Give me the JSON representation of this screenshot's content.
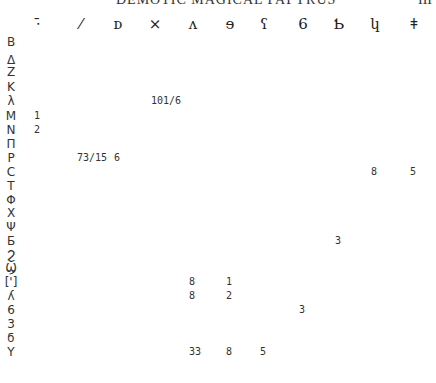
{
  "header": {
    "title": "DEMOTIC MAGICAL PAPYRUS",
    "page_number": "III"
  },
  "table": {
    "columns": [
      {
        "glyph": "⋅̄",
        "name": "demotic-sign-1",
        "x": 38
      },
      {
        "glyph": "⁄",
        "name": "demotic-sign-2",
        "x": 81
      },
      {
        "glyph": "ᴅ",
        "name": "demotic-sign-3",
        "x": 118
      },
      {
        "glyph": "×",
        "name": "demotic-sign-4",
        "x": 155
      },
      {
        "glyph": "ʌ",
        "name": "demotic-sign-5",
        "x": 193
      },
      {
        "glyph": "ɘ",
        "name": "demotic-sign-6",
        "x": 230
      },
      {
        "glyph": "ʕ",
        "name": "demotic-sign-7",
        "x": 264
      },
      {
        "glyph": "6",
        "name": "demotic-sign-8",
        "x": 303
      },
      {
        "glyph": "Ƅ",
        "name": "demotic-sign-9",
        "x": 339
      },
      {
        "glyph": "կ",
        "name": "demotic-sign-10",
        "x": 375
      },
      {
        "glyph": "ǂ",
        "name": "demotic-sign-11",
        "x": 414
      }
    ],
    "rows": [
      {
        "label": "B",
        "y": 42,
        "cells": []
      },
      {
        "label": "Δ",
        "y": 60,
        "cells": []
      },
      {
        "label": "Z",
        "y": 72,
        "cells": []
      },
      {
        "label": "K",
        "y": 87,
        "cells": []
      },
      {
        "label": "λ",
        "y": 101,
        "cells": [
          {
            "col": 3,
            "value": "101/6"
          }
        ]
      },
      {
        "label": "M",
        "y": 116,
        "cells": [
          {
            "col": 0,
            "value": "1"
          }
        ]
      },
      {
        "label": "N",
        "y": 130,
        "cells": [
          {
            "col": 0,
            "value": "2"
          }
        ]
      },
      {
        "label": "Π",
        "y": 144,
        "cells": []
      },
      {
        "label": "Ρ",
        "y": 158,
        "cells": [
          {
            "col": 1,
            "value": "73/15"
          },
          {
            "col": 2,
            "value": "6"
          }
        ]
      },
      {
        "label": "C",
        "y": 172,
        "cells": [
          {
            "col": 9,
            "value": "8"
          },
          {
            "col": 10,
            "value": "5"
          }
        ]
      },
      {
        "label": "T",
        "y": 186,
        "cells": []
      },
      {
        "label": "Φ",
        "y": 200,
        "cells": []
      },
      {
        "label": "X",
        "y": 213,
        "cells": []
      },
      {
        "label": "Ψ",
        "y": 227,
        "cells": []
      },
      {
        "label": "Ƃ",
        "y": 241,
        "cells": [
          {
            "col": 8,
            "value": "3"
          }
        ]
      },
      {
        "label": "Ϩ",
        "y": 255,
        "cells": []
      },
      {
        "label": "Ϣ",
        "y": 268,
        "cells": []
      },
      {
        "label": "[']",
        "y": 282,
        "cells": [
          {
            "col": 4,
            "value": "8"
          },
          {
            "col": 5,
            "value": "1"
          }
        ]
      },
      {
        "label": "ʎ",
        "y": 296,
        "cells": [
          {
            "col": 4,
            "value": "8"
          },
          {
            "col": 5,
            "value": "2"
          }
        ]
      },
      {
        "label": "6",
        "y": 310,
        "cells": [
          {
            "col": 7,
            "value": "3"
          }
        ]
      },
      {
        "label": "3",
        "y": 324,
        "cells": []
      },
      {
        "label": "ϭ",
        "y": 338,
        "cells": []
      },
      {
        "label": "Y",
        "y": 352,
        "cells": [
          {
            "col": 4,
            "value": "33"
          },
          {
            "col": 5,
            "value": "8"
          },
          {
            "col": 6,
            "value": "5"
          }
        ]
      }
    ]
  }
}
